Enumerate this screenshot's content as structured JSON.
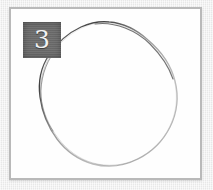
{
  "page": {
    "background_color": "#ececec",
    "width": 213,
    "height": 190
  },
  "frame": {
    "name": "image-frame",
    "border_color": "#b9b9b9",
    "canvas_color": "#ffffff"
  },
  "badge": {
    "label": "3",
    "background_color": "#6d6d6d",
    "text_color": "#f2f2f2"
  },
  "drawing": {
    "name": "hand-drawn-blob",
    "stroke_color": "#8a8a8a",
    "stroke_color_dark": "#4a4a4a",
    "stroke_width": 1.2,
    "description": "hand-drawn closed rounded blob / irregular circle",
    "path": "M 103 16 C 126 18 147 33 160 53 C 173 73 176 96 169 118 C 162 140 146 155 124 162 C 102 169 79 165 62 151 C 45 137 34 115 32 93 C 30 71 39 49 56 34 C 69 22 86 15 103 16 Z"
  }
}
